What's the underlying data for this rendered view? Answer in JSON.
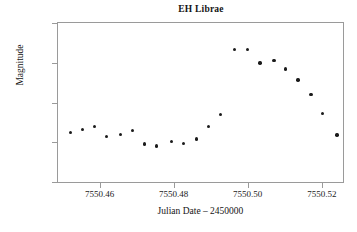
{
  "chart_data": {
    "type": "scatter",
    "title": "EH Librae",
    "xlabel": "Julian Date – 2450000",
    "ylabel": "Magnitude",
    "xlim": [
      7550.4485,
      7550.526
    ],
    "ylim": [
      9.395,
      10.205
    ],
    "y_inverted": true,
    "grid": false,
    "legend": null,
    "xticks": [
      7550.46,
      7550.48,
      7550.5,
      7550.52
    ],
    "xticklabels": [
      "7550.46",
      "7550.48",
      "7550.50",
      "7550.52"
    ],
    "yticks": [
      9.4,
      9.6,
      9.8,
      10.0,
      10.2
    ],
    "yticklabels": [
      "9.4",
      "9.6",
      "9.8",
      "10.0",
      "10.2"
    ],
    "marker": "filled-circle",
    "marker_color": "#1b1b1b",
    "marker_size": 3.4,
    "x": [
      7550.4519,
      7550.4551,
      7550.4584,
      7550.4616,
      7550.4654,
      7550.4686,
      7550.4719,
      7550.4751,
      7550.4792,
      7550.4824,
      7550.4859,
      7550.4891,
      7550.4924,
      7550.4962,
      7550.4997,
      7550.503,
      7550.5068,
      7550.51,
      7550.5133,
      7550.5168,
      7550.52,
      7550.5238
    ],
    "y": [
      9.946,
      9.931,
      9.916,
      9.966,
      9.957,
      9.937,
      10.003,
      10.013,
      9.992,
      10.0,
      9.978,
      9.915,
      9.856,
      9.529,
      9.527,
      9.597,
      9.584,
      9.627,
      9.681,
      9.755,
      9.849,
      9.958
    ],
    "points": [
      {
        "x": 7550.4519,
        "y": 9.946
      },
      {
        "x": 7550.4551,
        "y": 9.931
      },
      {
        "x": 7550.4584,
        "y": 9.916
      },
      {
        "x": 7550.4616,
        "y": 9.966
      },
      {
        "x": 7550.4654,
        "y": 9.957
      },
      {
        "x": 7550.4686,
        "y": 9.937
      },
      {
        "x": 7550.4719,
        "y": 10.003
      },
      {
        "x": 7550.4751,
        "y": 10.013
      },
      {
        "x": 7550.4792,
        "y": 9.992
      },
      {
        "x": 7550.4824,
        "y": 10.0
      },
      {
        "x": 7550.4859,
        "y": 9.978
      },
      {
        "x": 7550.4891,
        "y": 9.915
      },
      {
        "x": 7550.4924,
        "y": 9.856
      },
      {
        "x": 7550.4962,
        "y": 9.529
      },
      {
        "x": 7550.4997,
        "y": 9.527
      },
      {
        "x": 7550.503,
        "y": 9.597
      },
      {
        "x": 7550.5068,
        "y": 9.584
      },
      {
        "x": 7550.51,
        "y": 9.627
      },
      {
        "x": 7550.5133,
        "y": 9.681
      },
      {
        "x": 7550.5168,
        "y": 9.755
      },
      {
        "x": 7550.52,
        "y": 9.849
      },
      {
        "x": 7550.5238,
        "y": 9.958
      }
    ]
  }
}
